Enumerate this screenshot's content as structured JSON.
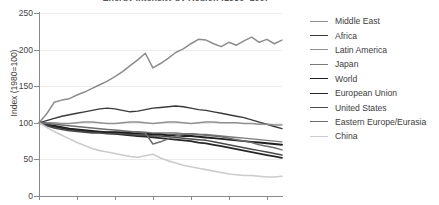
{
  "chart_data": {
    "type": "line",
    "title": "Energy Intensity by Region (1980=100)",
    "xlabel": "",
    "ylabel": "Index (1980=100)",
    "ylim": [
      0,
      250
    ],
    "yticks": [
      0,
      50,
      100,
      150,
      200,
      250
    ],
    "ytick_labels": [
      "0",
      "50",
      "100",
      "150",
      "200",
      "250"
    ],
    "xlim": [
      0,
      32
    ],
    "xticks": [
      0,
      5,
      10,
      15,
      20,
      25,
      30
    ],
    "grid": true,
    "legend_position": "right",
    "x": [
      0,
      1,
      2,
      3,
      4,
      5,
      6,
      7,
      8,
      9,
      10,
      11,
      12,
      13,
      14,
      15,
      16,
      17,
      18,
      19,
      20,
      21,
      22,
      23,
      24,
      25,
      26,
      27,
      28,
      29,
      30,
      31,
      32
    ],
    "series": [
      {
        "name": "Middle East",
        "color": "#8c8c8c",
        "width": 1.5,
        "values": [
          100,
          112,
          128,
          131,
          133,
          138,
          142,
          147,
          152,
          157,
          163,
          170,
          178,
          186,
          195,
          175,
          181,
          188,
          196,
          201,
          208,
          214,
          213,
          208,
          204,
          210,
          206,
          212,
          217,
          210,
          214,
          208,
          213
        ]
      },
      {
        "name": "Africa",
        "color": "#3a3a3a",
        "width": 1.4,
        "values": [
          100,
          103,
          106,
          109,
          111,
          113,
          115,
          117,
          119,
          120,
          119,
          117,
          115,
          116,
          118,
          120,
          121,
          122,
          123,
          122,
          120,
          118,
          117,
          115,
          113,
          111,
          109,
          107,
          104,
          101,
          98,
          95,
          92
        ]
      },
      {
        "name": "Latin America",
        "color": "#909090",
        "width": 1.4,
        "values": [
          100,
          100,
          100,
          99,
          99,
          100,
          101,
          101,
          100,
          99,
          99,
          100,
          101,
          101,
          100,
          99,
          100,
          101,
          101,
          100,
          99,
          100,
          101,
          101,
          100,
          100,
          100,
          99,
          99,
          98,
          98,
          97,
          97
        ]
      },
      {
        "name": "Japan",
        "color": "#7a7a7a",
        "width": 1.4,
        "values": [
          100,
          97,
          94,
          92,
          90,
          89,
          88,
          87,
          87,
          87,
          87,
          88,
          88,
          88,
          87,
          86,
          86,
          86,
          86,
          85,
          85,
          84,
          84,
          83,
          82,
          81,
          80,
          79,
          78,
          77,
          76,
          75,
          74
        ]
      },
      {
        "name": "World",
        "color": "#1f1f1f",
        "width": 1.9,
        "values": [
          100,
          98,
          96,
          94,
          92,
          91,
          90,
          89,
          88,
          87,
          87,
          86,
          86,
          85,
          85,
          84,
          84,
          83,
          83,
          82,
          82,
          81,
          80,
          79,
          78,
          77,
          76,
          75,
          74,
          73,
          72,
          71,
          70
        ]
      },
      {
        "name": "European Union",
        "color": "#272727",
        "width": 1.8,
        "values": [
          100,
          97,
          95,
          93,
          91,
          90,
          89,
          88,
          87,
          86,
          85,
          84,
          83,
          82,
          81,
          80,
          79,
          78,
          77,
          76,
          75,
          73,
          72,
          70,
          68,
          66,
          64,
          62,
          60,
          58,
          56,
          54,
          52
        ]
      },
      {
        "name": "United States",
        "color": "#4a4a4a",
        "width": 1.5,
        "values": [
          100,
          96,
          93,
          91,
          89,
          88,
          87,
          86,
          86,
          85,
          85,
          85,
          84,
          83,
          83,
          82,
          82,
          81,
          80,
          79,
          78,
          77,
          76,
          74,
          72,
          70,
          68,
          66,
          64,
          62,
          60,
          58,
          56
        ]
      },
      {
        "name": "Eastern Europe/Eurasia",
        "color": "#6e6e6e",
        "width": 1.5,
        "values": [
          100,
          99,
          98,
          97,
          96,
          95,
          94,
          93,
          92,
          91,
          90,
          89,
          88,
          87,
          86,
          71,
          74,
          78,
          82,
          84,
          85,
          84,
          83,
          82,
          81,
          79,
          77,
          75,
          73,
          70,
          68,
          66,
          63
        ]
      },
      {
        "name": "China",
        "color": "#cccccc",
        "width": 1.6,
        "values": [
          100,
          94,
          88,
          83,
          78,
          73,
          69,
          65,
          62,
          60,
          58,
          56,
          54,
          53,
          55,
          57,
          52,
          48,
          45,
          42,
          40,
          38,
          36,
          34,
          32,
          30,
          29,
          28,
          28,
          27,
          26,
          26,
          27
        ]
      }
    ]
  },
  "legend": {
    "items": [
      {
        "label": "Middle East"
      },
      {
        "label": "Africa"
      },
      {
        "label": "Latin America"
      },
      {
        "label": "Japan"
      },
      {
        "label": "World"
      },
      {
        "label": "European Union"
      },
      {
        "label": "United States"
      },
      {
        "label": "Eastern Europe/Eurasia"
      },
      {
        "label": "China"
      }
    ]
  }
}
